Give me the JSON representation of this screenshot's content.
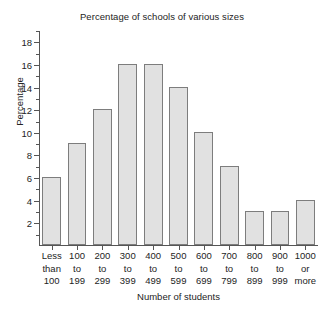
{
  "chart_data": {
    "type": "bar",
    "title": "Percentage of schools of various sizes",
    "xlabel": "Number of students",
    "ylabel": "Percentage",
    "categories": [
      "Less than 100",
      "100 to 199",
      "200 to 299",
      "300 to 399",
      "400 to 499",
      "500 to 599",
      "600 to 699",
      "700 to 799",
      "800 to 899",
      "900 to 999",
      "1000 or more"
    ],
    "category_label_lines": [
      [
        "Less",
        "than",
        "100"
      ],
      [
        "100",
        "to",
        "199"
      ],
      [
        "200",
        "to",
        "299"
      ],
      [
        "300",
        "to",
        "399"
      ],
      [
        "400",
        "to",
        "499"
      ],
      [
        "500",
        "to",
        "599"
      ],
      [
        "600",
        "to",
        "699"
      ],
      [
        "700",
        "to",
        "799"
      ],
      [
        "800",
        "to",
        "899"
      ],
      [
        "900",
        "to",
        "999"
      ],
      [
        "1000",
        "or",
        "more"
      ]
    ],
    "values": [
      6,
      9,
      12,
      16,
      16,
      14,
      10,
      7,
      3,
      3,
      4
    ],
    "ylim": [
      0,
      19
    ],
    "ytick_labels": [
      "2",
      "4",
      "6",
      "8",
      "10",
      "12",
      "14",
      "16",
      "18"
    ],
    "ytick_values": [
      2,
      4,
      6,
      8,
      10,
      12,
      14,
      16,
      18
    ],
    "yminor_tick_values": [
      1,
      3,
      5,
      7,
      9,
      11,
      13,
      15,
      17,
      19
    ],
    "grid": false,
    "legend": false,
    "bar_fill_color": "#e1e1e1",
    "bar_border_color": "#7d7d7d",
    "axis_color": "#555555",
    "text_color": "#242424",
    "background_color": "#ffffff"
  }
}
